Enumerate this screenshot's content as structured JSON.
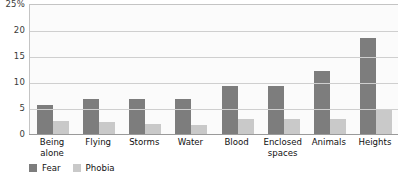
{
  "chart_data": {
    "type": "bar",
    "title": "",
    "xlabel": "",
    "ylabel": "",
    "ylim": [
      0,
      25
    ],
    "grid": true,
    "legend_position": "bottom-left",
    "y_ticks": [
      "25%",
      "20",
      "15",
      "10",
      "5",
      "0"
    ],
    "y_tick_values": [
      25,
      20,
      15,
      10,
      5,
      0
    ],
    "categories": [
      "Being\nalone",
      "Flying",
      "Storms",
      "Water",
      "Blood",
      "Enclosed\nspaces",
      "Animals",
      "Heights"
    ],
    "series": [
      {
        "name": "Fear",
        "color": "#7d7d7d",
        "values": [
          5.6,
          6.7,
          6.8,
          6.8,
          9.2,
          9.2,
          12.1,
          18.5
        ]
      },
      {
        "name": "Phobia",
        "color": "#c9c9c9",
        "values": [
          2.5,
          2.3,
          1.9,
          1.8,
          2.8,
          2.9,
          2.8,
          4.6
        ]
      }
    ]
  },
  "legend": {
    "items": [
      {
        "label": "Fear",
        "color": "#7d7d7d"
      },
      {
        "label": "Phobia",
        "color": "#c9c9c9"
      }
    ]
  },
  "colors": {
    "fear": "#7d7d7d",
    "phobia": "#c9c9c9",
    "gridline": "#cfcfcf",
    "plot_background": "#fbfbfb",
    "axis": "#9a9a9a"
  }
}
